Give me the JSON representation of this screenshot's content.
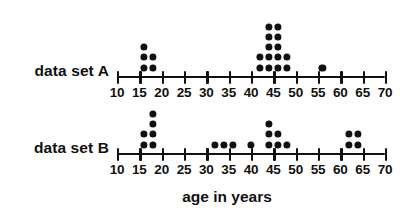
{
  "chart_data": {
    "type": "scatter",
    "title": "",
    "xlabel": "age in years",
    "ylabel": "",
    "xlim": [
      10,
      70
    ],
    "xticks": [
      10,
      15,
      20,
      25,
      30,
      35,
      40,
      45,
      50,
      55,
      60,
      65,
      70
    ],
    "xtick_labels": [
      "10",
      "15",
      "20",
      "25",
      "30",
      "35",
      "40",
      "45",
      "50",
      "55",
      "60",
      "65",
      "70"
    ],
    "grid": false,
    "legend": "none",
    "plot_style": "dot-plot",
    "series": [
      {
        "name": "data set A",
        "label": "data set A",
        "dot_columns": [
          {
            "value": 16,
            "count": 3
          },
          {
            "value": 18,
            "count": 2
          },
          {
            "value": 42,
            "count": 2
          },
          {
            "value": 44,
            "count": 5
          },
          {
            "value": 46,
            "count": 5
          },
          {
            "value": 48,
            "count": 2
          },
          {
            "value": 56,
            "count": 1
          }
        ],
        "values": [
          16,
          16,
          16,
          18,
          18,
          42,
          42,
          44,
          44,
          44,
          44,
          44,
          46,
          46,
          46,
          46,
          46,
          48,
          48,
          56
        ],
        "total": 20
      },
      {
        "name": "data set B",
        "label": "data set B",
        "dot_columns": [
          {
            "value": 16,
            "count": 2
          },
          {
            "value": 18,
            "count": 4
          },
          {
            "value": 32,
            "count": 1
          },
          {
            "value": 34,
            "count": 1
          },
          {
            "value": 36,
            "count": 1
          },
          {
            "value": 40,
            "count": 1
          },
          {
            "value": 44,
            "count": 3
          },
          {
            "value": 46,
            "count": 2
          },
          {
            "value": 48,
            "count": 1
          },
          {
            "value": 62,
            "count": 2
          },
          {
            "value": 64,
            "count": 2
          }
        ],
        "values": [
          16,
          16,
          18,
          18,
          18,
          18,
          32,
          34,
          36,
          40,
          44,
          44,
          44,
          46,
          46,
          48,
          62,
          62,
          64,
          64
        ],
        "total": 20
      }
    ]
  },
  "labels": {
    "series_a": "data set A",
    "series_b": "data set B",
    "axis_title": "age in years"
  },
  "colors": {
    "dot": "#111111",
    "axis": "#111111",
    "background": "#ffffff"
  }
}
